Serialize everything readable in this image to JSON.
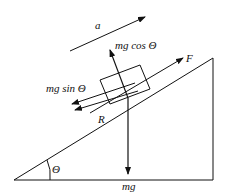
{
  "diagram": {
    "labels": {
      "acceleration": "a",
      "normal": "mg cos Θ",
      "applied_force": "F",
      "parallel_component": "mg sin Θ",
      "friction": "R",
      "angle": "Θ",
      "weight": "mg"
    },
    "colors": {
      "stroke": "#111111",
      "background": "#ffffff"
    }
  }
}
